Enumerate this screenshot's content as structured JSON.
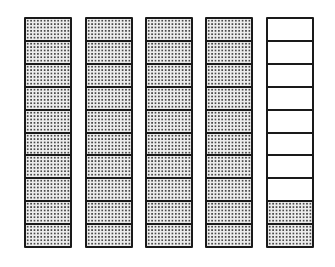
{
  "diagram": {
    "type": "decimal-strip-model",
    "cells_per_strip": 10,
    "colors": {
      "outline": "#1a1a1a",
      "shaded_fill": "#ececec",
      "dot": "#4a4a4a",
      "empty_fill": "#ffffff"
    },
    "strips": [
      {
        "left": 24,
        "shaded_cells": 10
      },
      {
        "left": 85,
        "shaded_cells": 10
      },
      {
        "left": 145,
        "shaded_cells": 10
      },
      {
        "left": 205,
        "shaded_cells": 10
      },
      {
        "left": 266,
        "shaded_cells": 2
      }
    ]
  }
}
